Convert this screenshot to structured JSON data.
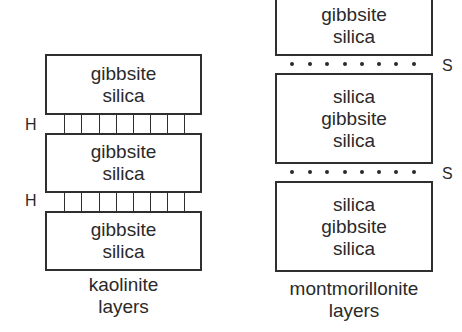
{
  "kaolinite": {
    "layers": [
      {
        "lines": [
          "gibbsite",
          "silica"
        ]
      },
      {
        "lines": [
          "gibbsite",
          "silica"
        ]
      },
      {
        "lines": [
          "gibbsite",
          "silica"
        ]
      }
    ],
    "bond_label": "H",
    "bond_label_2": "H",
    "caption_line1": "kaolinite",
    "caption_line2": "layers"
  },
  "montmorillonite": {
    "layers": [
      {
        "lines": [
          "gibbsite",
          "silica"
        ]
      },
      {
        "lines": [
          "silica",
          "gibbsite",
          "silica"
        ]
      },
      {
        "lines": [
          "silica",
          "gibbsite",
          "silica"
        ]
      }
    ],
    "gap_label": "S",
    "gap_label_2": "S",
    "caption_line1": "montmorillonite",
    "caption_line2": "layers"
  },
  "colors": {
    "line": "#2f2f2f",
    "text": "#2a2a2a",
    "background": "#ffffff"
  }
}
